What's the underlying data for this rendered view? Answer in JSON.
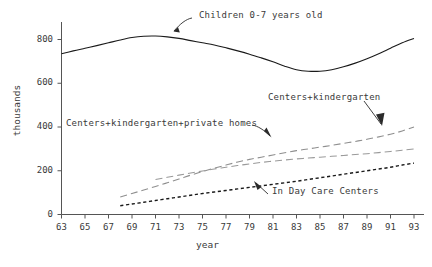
{
  "chart_data": {
    "type": "line",
    "title": "",
    "xlabel": "year",
    "ylabel": "thousands",
    "xlim": [
      63,
      93
    ],
    "ylim": [
      0,
      880
    ],
    "yticks": [
      0,
      200,
      400,
      600,
      800
    ],
    "ytick_labels": [
      "0",
      "200",
      "400",
      "600",
      "800"
    ],
    "xticks": [
      63,
      65,
      67,
      69,
      71,
      73,
      75,
      77,
      79,
      81,
      83,
      85,
      87,
      89,
      91,
      93
    ],
    "xtick_labels": [
      "63",
      "65",
      "67",
      "69",
      "71",
      "73",
      "75",
      "77",
      "79",
      "81",
      "83",
      "85",
      "87",
      "89",
      "91",
      "93"
    ],
    "grid": false,
    "legend": "none (inline annotations with arrows)",
    "series": [
      {
        "name": "Children 0-7 years old",
        "style": "solid",
        "color": "#1a1a1a",
        "x": [
          63,
          64,
          65,
          66,
          67,
          68,
          69,
          70,
          71,
          72,
          73,
          74,
          75,
          76,
          77,
          78,
          79,
          80,
          81,
          82,
          83,
          84,
          85,
          86,
          87,
          88,
          89,
          90,
          91,
          92,
          93
        ],
        "y": [
          735,
          748,
          760,
          772,
          785,
          798,
          809,
          815,
          816,
          812,
          805,
          795,
          785,
          775,
          762,
          748,
          733,
          716,
          698,
          678,
          662,
          655,
          655,
          662,
          675,
          692,
          712,
          735,
          760,
          785,
          805
        ]
      },
      {
        "name": "Centers+kindergarten+private homes",
        "style": "dashed",
        "color": "#8f8f8f",
        "x": [
          68,
          69,
          70,
          71,
          72,
          73,
          74,
          75,
          76,
          77,
          78,
          79,
          80,
          81,
          82,
          83,
          84,
          85,
          86,
          87,
          88,
          89,
          90,
          91,
          92,
          93
        ],
        "y": [
          80,
          96,
          112,
          128,
          145,
          162,
          180,
          196,
          212,
          226,
          240,
          252,
          262,
          272,
          282,
          292,
          300,
          308,
          316,
          325,
          334,
          344,
          355,
          367,
          382,
          400
        ]
      },
      {
        "name": "Centers+kindergarten",
        "style": "dashed",
        "color": "#9a9a9a",
        "x": [
          71,
          72,
          73,
          74,
          75,
          76,
          77,
          78,
          79,
          80,
          81,
          82,
          83,
          84,
          85,
          86,
          87,
          88,
          89,
          90,
          91,
          92,
          93
        ],
        "y": [
          160,
          170,
          180,
          190,
          199,
          208,
          216,
          224,
          231,
          238,
          244,
          249,
          254,
          258,
          262,
          266,
          270,
          274,
          278,
          283,
          288,
          294,
          300
        ]
      },
      {
        "name": "In Day Care Centers",
        "style": "dotted",
        "color": "#1a1a1a",
        "x": [
          68,
          69,
          70,
          71,
          72,
          73,
          74,
          75,
          76,
          77,
          78,
          79,
          80,
          81,
          82,
          83,
          84,
          85,
          86,
          87,
          88,
          89,
          90,
          91,
          92,
          93
        ],
        "y": [
          40,
          48,
          56,
          64,
          72,
          80,
          88,
          96,
          103,
          110,
          117,
          124,
          131,
          138,
          145,
          152,
          160,
          168,
          176,
          184,
          192,
          200,
          208,
          216,
          226,
          235
        ]
      }
    ],
    "annotations": [
      {
        "text": "Children 0-7 years old",
        "target_series": "Children 0-7 years old",
        "arrow": "down-left"
      },
      {
        "text": "Centers+kindergarten",
        "target_series": "Centers+kindergarten+private homes",
        "arrow": "down-right"
      },
      {
        "text": "Centers+kindergarten+private homes",
        "target_series": "Centers+kindergarten",
        "arrow": "down-right"
      },
      {
        "text": "In Day Care Centers",
        "target_series": "In Day Care Centers",
        "arrow": "up-left"
      }
    ]
  },
  "axes": {
    "y_title": "thousands",
    "x_title": "year"
  }
}
